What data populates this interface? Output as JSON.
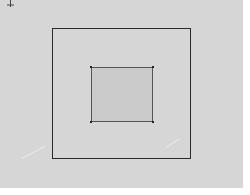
{
  "canvas": {
    "background": "#d6d6d6",
    "width": 243,
    "height": 188
  },
  "handle": {
    "icon": "move-crosshair-icon"
  },
  "shapes": {
    "outer_square": {
      "x": 52,
      "y": 28,
      "width": 139,
      "height": 131,
      "stroke": "#2a2a2a",
      "fill": "transparent"
    },
    "inner_square": {
      "x": 91,
      "y": 67,
      "width": 62,
      "height": 55,
      "stroke": "#555555",
      "fill": "#cbcbcb"
    }
  }
}
